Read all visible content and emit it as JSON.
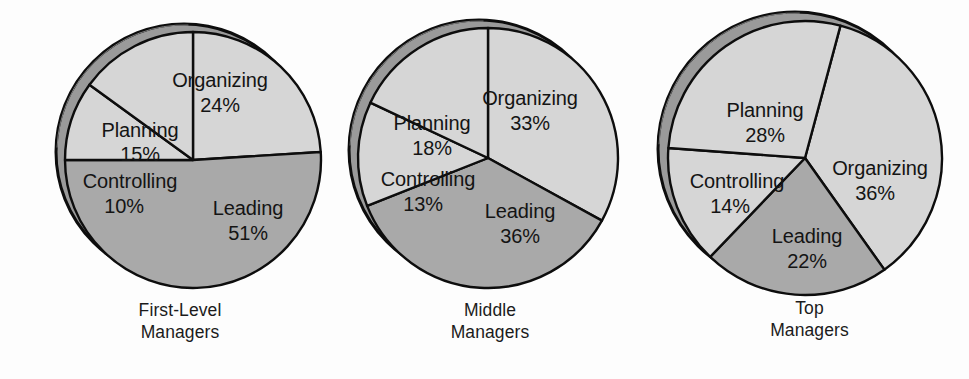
{
  "figure": {
    "background_color": "#fdfdfd",
    "text_color": "#141414",
    "colors": {
      "light_slice": "#d6d6d6",
      "dark_slice": "#a9a9a9",
      "rim_band": "#9a9a9a",
      "outline": "#0d0d0d"
    }
  },
  "chart_data": {
    "type": "pie",
    "title": "",
    "note": "Three pie charts comparing how managers at different levels distribute time among the four management functions",
    "categories": [
      "Planning",
      "Organizing",
      "Leading",
      "Controlling"
    ],
    "charts": [
      {
        "id": "first-level-managers",
        "caption_lines": [
          "First-Level",
          "Managers"
        ],
        "slices": [
          {
            "label": "Organizing",
            "value": 24,
            "value_text": "24%",
            "shade": "light"
          },
          {
            "label": "Leading",
            "value": 51,
            "value_text": "51%",
            "shade": "dark"
          },
          {
            "label": "Controlling",
            "value": 10,
            "value_text": "10%",
            "shade": "light"
          },
          {
            "label": "Planning",
            "value": 15,
            "value_text": "15%",
            "shade": "light"
          }
        ]
      },
      {
        "id": "middle-managers",
        "caption_lines": [
          "Middle",
          "Managers"
        ],
        "slices": [
          {
            "label": "Organizing",
            "value": 33,
            "value_text": "33%",
            "shade": "light"
          },
          {
            "label": "Leading",
            "value": 36,
            "value_text": "36%",
            "shade": "dark"
          },
          {
            "label": "Controlling",
            "value": 13,
            "value_text": "13%",
            "shade": "light"
          },
          {
            "label": "Planning",
            "value": 18,
            "value_text": "18%",
            "shade": "light"
          }
        ]
      },
      {
        "id": "top-managers",
        "caption_lines": [
          "Top",
          "Managers"
        ],
        "slices": [
          {
            "label": "Organizing",
            "value": 36,
            "value_text": "36%",
            "shade": "light"
          },
          {
            "label": "Leading",
            "value": 22,
            "value_text": "22%",
            "shade": "dark"
          },
          {
            "label": "Controlling",
            "value": 14,
            "value_text": "14%",
            "shade": "light"
          },
          {
            "label": "Planning",
            "value": 28,
            "value_text": "28%",
            "shade": "light"
          }
        ]
      }
    ]
  },
  "charts_layout": [
    {
      "left": 20,
      "width": 320,
      "cx": 173,
      "cy": 160,
      "r": 128,
      "rim_dx": -9,
      "rim_dy": -8,
      "start_angle": -90,
      "caption_top": 300,
      "labels": [
        {
          "label_x": 200,
          "label_y": 87,
          "pct_x": 200,
          "pct_y": 112
        },
        {
          "label_x": 228,
          "label_y": 215,
          "pct_x": 228,
          "pct_y": 240
        },
        {
          "label_x": 110,
          "label_y": 188,
          "pct_x": 104,
          "pct_y": 213
        },
        {
          "label_x": 120,
          "label_y": 137,
          "pct_x": 120,
          "pct_y": 161
        }
      ]
    },
    {
      "left": 340,
      "width": 300,
      "cx": 148,
      "cy": 158,
      "r": 130,
      "rim_dx": -9,
      "rim_dy": -8,
      "start_angle": -90,
      "caption_top": 300,
      "labels": [
        {
          "label_x": 190,
          "label_y": 105,
          "pct_x": 190,
          "pct_y": 130
        },
        {
          "label_x": 180,
          "label_y": 218,
          "pct_x": 180,
          "pct_y": 243
        },
        {
          "label_x": 88,
          "label_y": 186,
          "pct_x": 83,
          "pct_y": 211
        },
        {
          "label_x": 92,
          "label_y": 130,
          "pct_x": 92,
          "pct_y": 155
        }
      ]
    },
    {
      "left": 650,
      "width": 319,
      "cx": 155,
      "cy": 158,
      "r": 137,
      "rim_dx": -10,
      "rim_dy": -9,
      "start_angle": -75,
      "caption_top": 298,
      "labels": [
        {
          "label_x": 230,
          "label_y": 175,
          "pct_x": 225,
          "pct_y": 200
        },
        {
          "label_x": 157,
          "label_y": 243,
          "pct_x": 157,
          "pct_y": 268
        },
        {
          "label_x": 87,
          "label_y": 188,
          "pct_x": 80,
          "pct_y": 213
        },
        {
          "label_x": 115,
          "label_y": 117,
          "pct_x": 115,
          "pct_y": 142
        }
      ]
    }
  ]
}
